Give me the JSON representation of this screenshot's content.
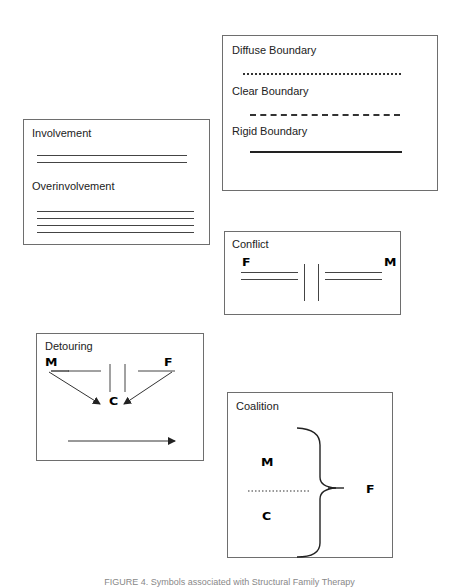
{
  "boundaries": {
    "diffuse_label": "Diffuse Boundary",
    "clear_label": "Clear Boundary",
    "rigid_label": "Rigid Boundary"
  },
  "involvement": {
    "involvement_label": "Involvement",
    "overinvolvement_label": "Overinvolvement",
    "involvement_line_count": 2,
    "overinvolvement_line_count": 4
  },
  "conflict": {
    "title": "Conflict",
    "left_node": "F",
    "right_node": "M"
  },
  "detouring": {
    "title": "Detouring",
    "left_node": "M",
    "right_node": "F",
    "target_node": "C"
  },
  "coalition": {
    "title": "Coalition",
    "top_node": "M",
    "bottom_node": "C",
    "right_node": "F"
  },
  "caption": "FIGURE 4. Symbols associated with Structural Family Therapy"
}
